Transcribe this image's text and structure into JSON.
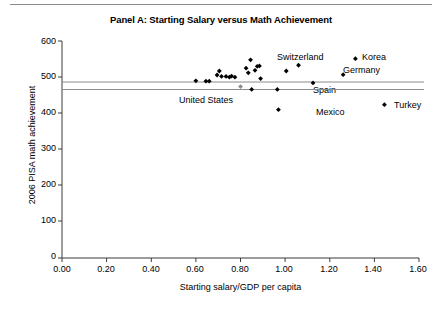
{
  "figure": {
    "title": "Panel A: Starting Salary versus Math Achievement",
    "rule": "horizontal-rule"
  },
  "chart_data": {
    "type": "scatter",
    "title": "Panel A: Starting Salary versus Math Achievement",
    "xlabel": "Starting salary/GDP per capita",
    "ylabel": "2006 PISA math achievement",
    "xlim": [
      0.0,
      1.6
    ],
    "ylim": [
      0,
      600
    ],
    "xticks": [
      "0.00",
      "0.20",
      "0.40",
      "0.60",
      "0.80",
      "1.00",
      "1.20",
      "1.40",
      "1.60"
    ],
    "xtick_values": [
      0.0,
      0.2,
      0.4,
      0.6,
      0.8,
      1.0,
      1.2,
      1.4,
      1.6
    ],
    "yticks": [
      "0",
      "100",
      "200",
      "300",
      "400",
      "500",
      "600"
    ],
    "ytick_values": [
      0,
      100,
      200,
      300,
      400,
      500,
      600
    ],
    "grid": false,
    "legend": null,
    "marker": "diamond",
    "marker_color": "#000000",
    "reference_lines": [
      {
        "name": "upper-reference-line",
        "y": 483,
        "color": "#808080"
      },
      {
        "name": "lower-reference-line",
        "y": 462,
        "color": "#808080"
      }
    ],
    "points": [
      {
        "x": 0.6,
        "y": 490,
        "label": null
      },
      {
        "x": 0.645,
        "y": 489,
        "label": null
      },
      {
        "x": 0.66,
        "y": 489,
        "label": null
      },
      {
        "x": 0.695,
        "y": 506,
        "label": null
      },
      {
        "x": 0.705,
        "y": 517,
        "label": null
      },
      {
        "x": 0.715,
        "y": 502,
        "label": null
      },
      {
        "x": 0.735,
        "y": 502,
        "label": null
      },
      {
        "x": 0.75,
        "y": 500,
        "label": null
      },
      {
        "x": 0.76,
        "y": 503,
        "label": null
      },
      {
        "x": 0.775,
        "y": 500,
        "label": null
      },
      {
        "x": 0.8,
        "y": 474,
        "label": "United States",
        "color": "#8c8c8c"
      },
      {
        "x": 0.825,
        "y": 525,
        "label": null
      },
      {
        "x": 0.835,
        "y": 512,
        "label": null
      },
      {
        "x": 0.845,
        "y": 548,
        "label": null
      },
      {
        "x": 0.85,
        "y": 466,
        "label": null
      },
      {
        "x": 0.865,
        "y": 519,
        "label": null
      },
      {
        "x": 0.875,
        "y": 530,
        "label": null
      },
      {
        "x": 0.885,
        "y": 531,
        "label": null
      },
      {
        "x": 0.89,
        "y": 496,
        "label": null
      },
      {
        "x": 0.965,
        "y": 466,
        "label": null
      },
      {
        "x": 0.97,
        "y": 410,
        "label": "Mexico"
      },
      {
        "x": 1.005,
        "y": 517,
        "label": null
      },
      {
        "x": 1.06,
        "y": 533,
        "label": "Switzerland"
      },
      {
        "x": 1.125,
        "y": 484,
        "label": "Spain"
      },
      {
        "x": 1.26,
        "y": 507,
        "label": "Germany"
      },
      {
        "x": 1.315,
        "y": 551,
        "label": "Korea"
      },
      {
        "x": 1.445,
        "y": 424,
        "label": "Turkey"
      }
    ],
    "annotations": [
      {
        "text": "Switzerland",
        "x_px": 277,
        "y_px": 57
      },
      {
        "text": "Korea",
        "x_px": 362,
        "y_px": 57
      },
      {
        "text": "Germany",
        "x_px": 343,
        "y_px": 70
      },
      {
        "text": "Spain",
        "x_px": 312,
        "y_px": 90
      },
      {
        "text": "United States",
        "x_px": 180,
        "y_px": 100
      },
      {
        "text": "Mexico",
        "x_px": 315,
        "y_px": 112
      },
      {
        "text": "Turkey",
        "x_px": 394,
        "y_px": 105
      }
    ]
  }
}
